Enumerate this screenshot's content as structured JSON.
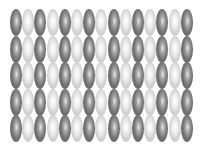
{
  "pattern": {
    "description": "grid of ellipsoid beads, alternating dark and light gray columns",
    "columns": 15,
    "rows": 5,
    "column_pitch_px": 12.2,
    "row_pitch_px": 26.5,
    "bead_width_px": 12,
    "bead_height_px": 27,
    "first_column_shade": "dark",
    "colors": {
      "dark": "#8a8a8a",
      "light": "#e6e6e6",
      "background": "#ffffff"
    }
  }
}
